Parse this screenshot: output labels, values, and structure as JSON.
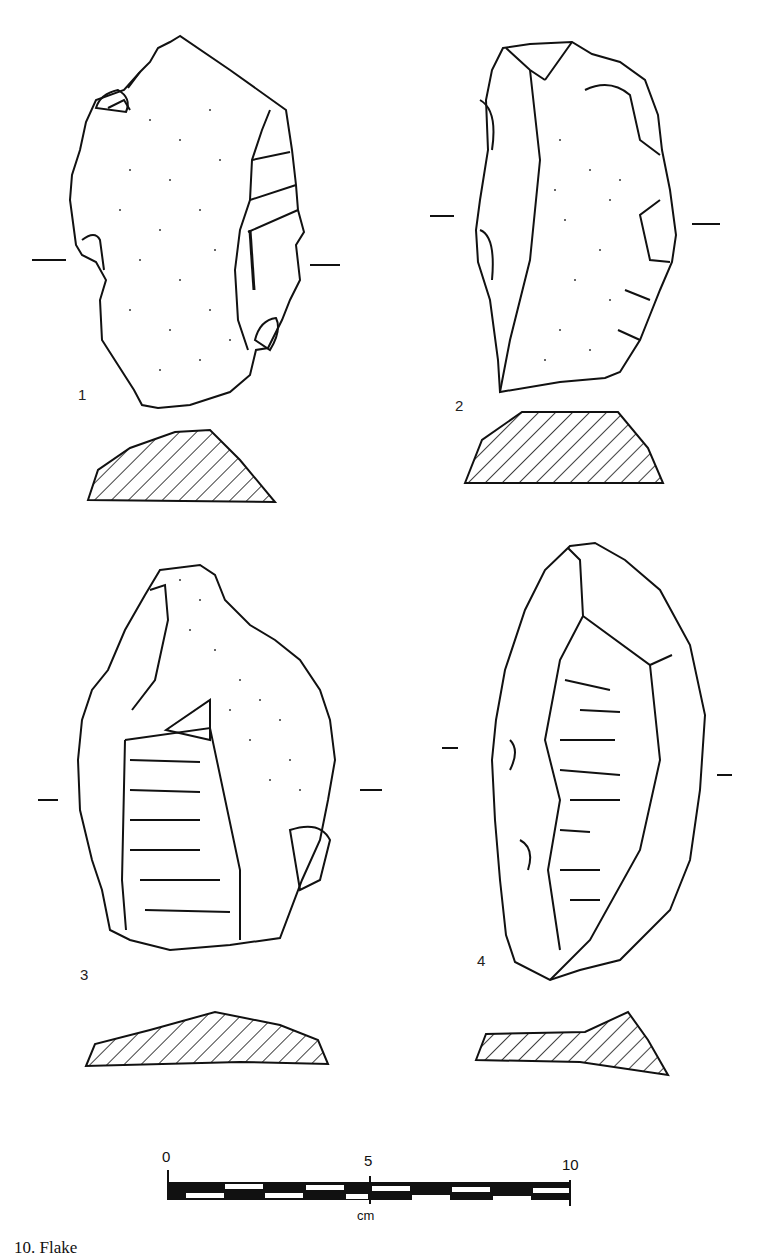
{
  "figure": {
    "type": "lithic artifact illustration plate",
    "artifacts": [
      {
        "number": "1"
      },
      {
        "number": "2"
      },
      {
        "number": "3"
      },
      {
        "number": "4"
      }
    ],
    "scale_bar": {
      "ticks": [
        "0",
        "5",
        "10"
      ],
      "unit": "cm"
    },
    "caption_partial": "10. Flake"
  }
}
